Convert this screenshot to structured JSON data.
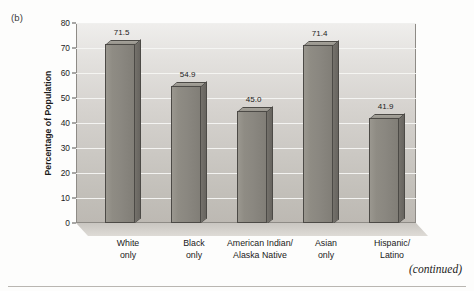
{
  "figure": {
    "panel_label": "(b)",
    "continued_note": "(continued)"
  },
  "chart_data": {
    "type": "bar",
    "title": "",
    "xlabel": "",
    "ylabel": "Percentage of Population",
    "ylim": [
      0,
      80
    ],
    "ytick_step": 10,
    "yticks": [
      0,
      10,
      20,
      30,
      40,
      50,
      60,
      70,
      80
    ],
    "grid": true,
    "legend": false,
    "categories": [
      "White\nonly",
      "Black\nonly",
      "American Indian/\nAlaska Native",
      "Asian\nonly",
      "Hispanic/\nLatino"
    ],
    "category_lines": [
      [
        "White",
        "only"
      ],
      [
        "Black",
        "only"
      ],
      [
        "American Indian/",
        "Alaska Native"
      ],
      [
        "Asian",
        "only"
      ],
      [
        "Hispanic/",
        "Latino"
      ]
    ],
    "values": [
      71.5,
      54.9,
      45.0,
      71.4,
      41.9
    ],
    "value_labels": [
      "71.5",
      "54.9",
      "45.0",
      "71.4",
      "41.9"
    ],
    "bar_color": "#8a8780",
    "bar_side_color": "#6e6b66",
    "bar_outline_color": "#4c4a46",
    "plot_bg_top": "#efeeec",
    "plot_bg_bottom": "#bdb9b3",
    "gridline_color": "#f6f5f3"
  }
}
